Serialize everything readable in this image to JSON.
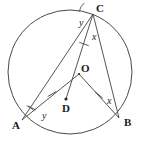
{
  "figure": {
    "background_color": "#ffffff",
    "line_color": "#4a4a4a",
    "width": 141,
    "height": 147
  },
  "circle": {
    "name": "main-circle",
    "center_x": 70,
    "center_y": 72,
    "radius": 62
  },
  "points": [
    {
      "id": "C",
      "label": "C",
      "x": 93,
      "y": 14,
      "label_x": 96,
      "label_y": 12,
      "on_circle": true
    },
    {
      "id": "A",
      "label": "A",
      "x": 22,
      "y": 120,
      "label_x": 12,
      "label_y": 129,
      "on_circle": true
    },
    {
      "id": "B",
      "label": "B",
      "x": 119,
      "y": 118,
      "label_x": 124,
      "label_y": 126,
      "on_circle": true
    },
    {
      "id": "O",
      "label": "O",
      "x": 79,
      "y": 74,
      "label_x": 81,
      "label_y": 72,
      "on_circle": false
    },
    {
      "id": "D",
      "label": "D",
      "x": 66,
      "y": 99,
      "label_x": 62,
      "label_y": 112,
      "on_circle": false
    }
  ],
  "segments": [
    {
      "id": "CA",
      "name": "chord-c-a",
      "from": "C",
      "to": "A",
      "tick": false
    },
    {
      "id": "CD",
      "name": "line-c-through-o-to-d",
      "from": "C",
      "to": "D",
      "tick": false
    },
    {
      "id": "CB",
      "name": "chord-c-b",
      "from": "C",
      "to": "B",
      "tick": false
    },
    {
      "id": "OA",
      "name": "radius-o-a",
      "from": "O",
      "to": "A",
      "tick": true
    },
    {
      "id": "OB",
      "name": "radius-o-b",
      "from": "O",
      "to": "B",
      "tick": true
    },
    {
      "id": "CO",
      "name": "radius-c-o",
      "from": "C",
      "to": "O",
      "tick": true
    }
  ],
  "tick_marks": [
    {
      "name": "tick-on-radius-co",
      "x": 84,
      "y": 44,
      "angle": 20
    },
    {
      "name": "tick-on-radius-oa",
      "x": 52,
      "y": 94,
      "angle": -30
    },
    {
      "name": "tick-on-radius-ob",
      "x": 99,
      "y": 95,
      "angle": 40
    }
  ],
  "angle_labels": [
    {
      "id": "y-at-C",
      "name": "angle-label-y-at-c",
      "text": "y",
      "x": 79,
      "y": 26
    },
    {
      "id": "x-at-C",
      "name": "angle-label-x-at-c",
      "text": "x",
      "x": 92,
      "y": 40
    },
    {
      "id": "y-at-A",
      "name": "angle-label-y-at-a",
      "text": "y",
      "x": 42,
      "y": 119
    },
    {
      "id": "x-at-B",
      "name": "angle-label-x-at-b",
      "text": "x",
      "x": 107,
      "y": 104
    }
  ],
  "angle_arcs": [
    {
      "name": "angle-arc-at-c-y",
      "cx": 93,
      "cy": 14,
      "r": 14,
      "a1": 190,
      "a2": 232
    },
    {
      "name": "angle-arc-at-a-y",
      "cx": 22,
      "cy": 120,
      "r": 15,
      "a1": -72,
      "a2": -36
    }
  ]
}
